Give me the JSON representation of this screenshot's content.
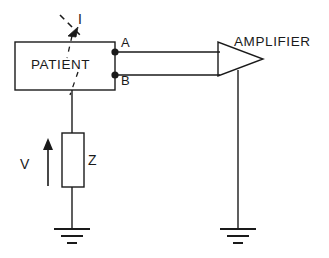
{
  "diagram": {
    "stroke_color": "#1a1a1a",
    "background_color": "#ffffff",
    "blocks": {
      "patient": {
        "label": "PATIENT",
        "x": 15,
        "y": 42,
        "width": 100,
        "height": 48
      },
      "impedance": {
        "label": "Z",
        "x": 62,
        "y": 133,
        "width": 22,
        "height": 54
      },
      "amplifier": {
        "label": "AMPLIFIER",
        "x": 218,
        "y": 42,
        "width": 44,
        "height": 34
      }
    },
    "terminals": [
      {
        "label": "A",
        "x": 115,
        "y": 52
      },
      {
        "label": "B",
        "x": 115,
        "y": 75
      }
    ],
    "annotations": {
      "current": {
        "label": "I",
        "description": "dashed leakage current path with arrowhead"
      },
      "voltage": {
        "label": "V",
        "description": "upward arrow indicating voltage across Z"
      }
    },
    "grounds": [
      {
        "name": "impedance-ground",
        "x": 72,
        "y": 228
      },
      {
        "name": "amplifier-ground",
        "x": 238,
        "y": 228
      }
    ]
  }
}
